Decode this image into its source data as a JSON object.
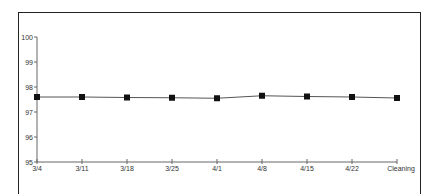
{
  "chart_data": {
    "type": "line",
    "title": "",
    "xlabel": "",
    "ylabel": "",
    "categories": [
      "3/4",
      "3/11",
      "3/18",
      "3/25",
      "4/1",
      "4/8",
      "4/15",
      "4/22",
      "Cleaning"
    ],
    "series": [
      {
        "name": "",
        "marker": "square",
        "color": "#111111",
        "values": [
          97.6,
          97.6,
          97.58,
          97.57,
          97.55,
          97.65,
          97.62,
          97.6,
          97.56
        ]
      }
    ],
    "yticks": [
      "95",
      "96",
      "97",
      "98",
      "99",
      "100"
    ],
    "ylim": [
      95,
      100
    ],
    "grid": false,
    "legend": "none"
  }
}
